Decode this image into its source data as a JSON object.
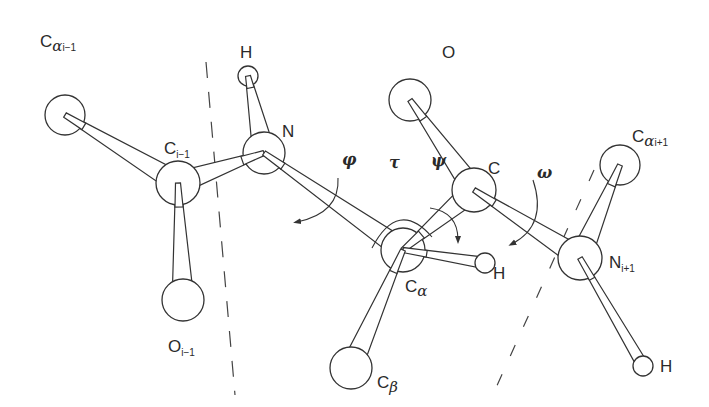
{
  "diagram": {
    "stroke_color": "#333333",
    "fill_color": "#ffffff",
    "atoms": [
      {
        "id": "ca_prev",
        "cx": 65,
        "cy": 115,
        "r": 20
      },
      {
        "id": "c_prev",
        "cx": 178,
        "cy": 183,
        "r": 22
      },
      {
        "id": "o_prev",
        "cx": 183,
        "cy": 300,
        "r": 21
      },
      {
        "id": "h_n",
        "cx": 248,
        "cy": 76,
        "r": 10
      },
      {
        "id": "n",
        "cx": 264,
        "cy": 153,
        "r": 21
      },
      {
        "id": "o",
        "cx": 410,
        "cy": 100,
        "r": 21
      },
      {
        "id": "c",
        "cx": 474,
        "cy": 190,
        "r": 22
      },
      {
        "id": "ca",
        "cx": 403,
        "cy": 250,
        "r": 22
      },
      {
        "id": "h_ca",
        "cx": 485,
        "cy": 263,
        "r": 10
      },
      {
        "id": "cb",
        "cx": 351,
        "cy": 368,
        "r": 21
      },
      {
        "id": "ca_next",
        "cx": 620,
        "cy": 165,
        "r": 20
      },
      {
        "id": "n_next",
        "cx": 580,
        "cy": 258,
        "r": 22
      },
      {
        "id": "h_next",
        "cx": 643,
        "cy": 366,
        "r": 10
      }
    ],
    "bonds": [
      {
        "from": "ca_prev",
        "to": "c_prev"
      },
      {
        "from": "c_prev",
        "to": "o_prev"
      },
      {
        "from": "n",
        "to": "c_prev"
      },
      {
        "from": "h_n",
        "to": "n"
      },
      {
        "from": "n",
        "to": "ca"
      },
      {
        "from": "o",
        "to": "c"
      },
      {
        "from": "ca",
        "to": "c"
      },
      {
        "from": "ca",
        "to": "h_ca"
      },
      {
        "from": "ca",
        "to": "cb"
      },
      {
        "from": "c",
        "to": "n_next"
      },
      {
        "from": "ca_next",
        "to": "n_next"
      },
      {
        "from": "n_next",
        "to": "h_next"
      }
    ],
    "labels": {
      "ca_prev": {
        "base": "C",
        "greek": "α",
        "sub": "i−1"
      },
      "c_prev": {
        "base": "C",
        "sub": "i−1"
      },
      "o_prev": {
        "base": "O",
        "sub": "i−1"
      },
      "h_n": {
        "base": "H"
      },
      "n": {
        "base": "N"
      },
      "o": {
        "base": "O"
      },
      "c": {
        "base": "C"
      },
      "ca": {
        "base": "C",
        "greek": "α"
      },
      "h_ca": {
        "base": "H"
      },
      "cb": {
        "base": "C",
        "greek": "β"
      },
      "ca_next": {
        "base": "C",
        "greek": "α",
        "sub": "i+1"
      },
      "n_next": {
        "base": "N",
        "sub": "i+1"
      },
      "h_next": {
        "base": "H"
      }
    },
    "angles": {
      "phi": "φ",
      "tau": "τ",
      "psi": "ψ",
      "omega": "ω"
    }
  }
}
